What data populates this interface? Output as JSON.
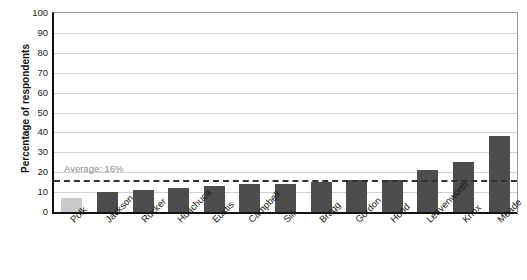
{
  "chart_data": {
    "type": "bar",
    "title": "",
    "subtitle": "",
    "xlabel": "",
    "ylabel": "Percentage of respondents",
    "ylim": [
      0,
      100
    ],
    "yticks": [
      0,
      10,
      20,
      30,
      40,
      50,
      60,
      70,
      80,
      90,
      100
    ],
    "grid": true,
    "legend": "none",
    "categories": [
      "Polk",
      "Jackson",
      "Rucker",
      "Huachuca",
      "Eustis",
      "Campbell",
      "Sill",
      "Bragg",
      "Gordon",
      "Hood",
      "Leavenworth",
      "Knox",
      "Meade"
    ],
    "values": [
      7,
      10,
      11,
      12,
      13,
      14,
      14,
      15,
      16,
      16,
      21,
      25,
      38
    ],
    "highlight_index": 0,
    "annotations": [
      {
        "name": "average-line",
        "label": "Average: 16%",
        "value": 16,
        "style": "dashed"
      }
    ],
    "colors": {
      "bar": "#4d4d4d",
      "bar_highlight": "#c9c9c9",
      "average_line": "#333333",
      "average_label": "#8c8c8c",
      "gridline": "#d2d2d2",
      "axis": "#111111"
    }
  }
}
